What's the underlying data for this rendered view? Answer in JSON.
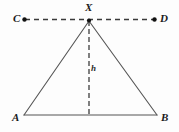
{
  "figure": {
    "type": "geometry-diagram",
    "width": 179,
    "height": 132,
    "background_color": "#fdfdfd",
    "stroke_color": "#4a4a4a",
    "label_color": "#1a1a1a"
  },
  "labels": {
    "point_c": "C",
    "point_d": "D",
    "point_x": "X",
    "point_a": "A",
    "point_b": "B",
    "altitude": "h"
  },
  "points": {
    "C": {
      "x": 24,
      "y": 19
    },
    "D": {
      "x": 155,
      "y": 19
    },
    "X": {
      "x": 89,
      "y": 21
    },
    "A": {
      "x": 24,
      "y": 115
    },
    "B": {
      "x": 157,
      "y": 115
    },
    "foot": {
      "x": 89,
      "y": 115
    }
  },
  "segments": {
    "line_cd": {
      "from": "C",
      "to": "D",
      "style": "dashed",
      "label": "CD"
    },
    "side_xa": {
      "from": "X",
      "to": "A",
      "style": "solid",
      "label": "XA"
    },
    "side_xb": {
      "from": "X",
      "to": "B",
      "style": "solid",
      "label": "XB"
    },
    "base_ab": {
      "from": "A",
      "to": "B",
      "style": "solid",
      "label": "AB"
    },
    "altitude_h": {
      "from": "X",
      "to": "foot",
      "style": "dashed",
      "label": "h"
    }
  },
  "markers": {
    "dot_c": "endpoint-dot",
    "dot_d": "endpoint-dot",
    "dot_x": "apex-dot"
  }
}
